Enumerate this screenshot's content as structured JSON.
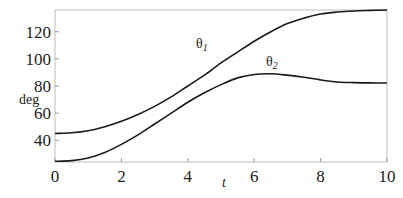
{
  "chart_data": {
    "type": "line",
    "title": "",
    "xlabel": "t",
    "ylabel": "deg",
    "xlim": [
      0,
      10
    ],
    "ylim": [
      24,
      136
    ],
    "xticks": [
      0,
      2,
      4,
      6,
      8,
      10
    ],
    "yticks": [
      40,
      60,
      80,
      100,
      120
    ],
    "grid": false,
    "legend": "inline curve labels",
    "x": [
      0,
      0.5,
      1,
      1.5,
      2,
      2.5,
      3,
      3.5,
      4,
      4.5,
      5,
      5.5,
      6,
      6.5,
      7,
      7.5,
      8,
      8.5,
      9,
      9.5,
      10
    ],
    "series": [
      {
        "name": "θ1",
        "values": [
          45,
          45.5,
          47,
          50,
          54,
          59,
          65,
          72,
          80,
          88,
          97,
          105,
          113,
          120,
          126,
          130,
          133,
          134.5,
          135.3,
          135.7,
          136
        ]
      },
      {
        "name": "θ2",
        "values": [
          24.5,
          25,
          27,
          31,
          37,
          44,
          52,
          60,
          68,
          75,
          81,
          86,
          88.5,
          89,
          88,
          86.5,
          84.5,
          83,
          82.5,
          82.3,
          82.2
        ]
      }
    ],
    "annotations": [
      {
        "text": "θ1",
        "x": 4.3,
        "y": 109
      },
      {
        "text": "θ2",
        "x": 6.1,
        "y": 95
      }
    ]
  },
  "labels": {
    "ylabel": "deg",
    "xlabel": "t",
    "theta1_base": "θ",
    "theta1_sub": "1",
    "theta2_base": "θ",
    "theta2_sub": "2"
  }
}
